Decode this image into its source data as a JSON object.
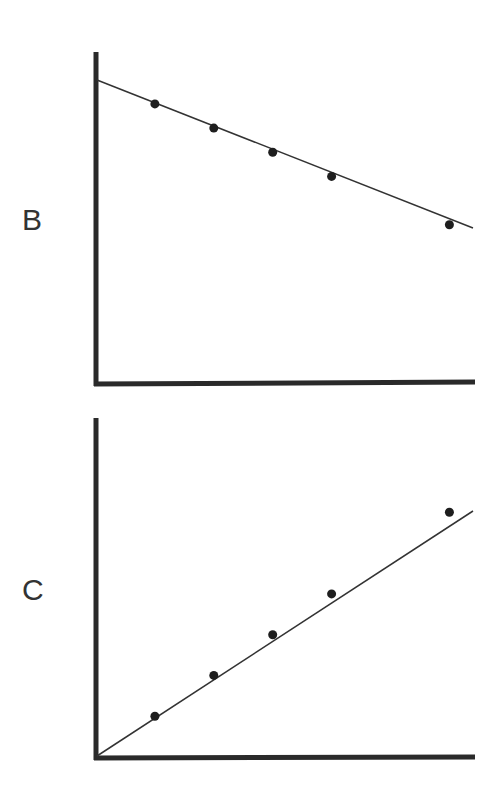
{
  "chart_data": [
    {
      "type": "scatter",
      "panel_label": "B",
      "title": "",
      "xlabel": "",
      "ylabel": "",
      "grid": false,
      "legend": null,
      "trend": "linear decreasing, positive y-intercept",
      "x": [
        1,
        2,
        3,
        4,
        6
      ],
      "values": [
        5.8,
        5.3,
        4.8,
        4.3,
        3.3
      ],
      "fit_line": {
        "intercept": 6.3,
        "slope": -0.5
      },
      "xlim": [
        0,
        6.4
      ],
      "ylim": [
        0,
        7.0
      ]
    },
    {
      "type": "scatter",
      "panel_label": "C",
      "title": "",
      "xlabel": "",
      "ylabel": "",
      "grid": false,
      "legend": null,
      "trend": "linear increasing through origin",
      "x": [
        1,
        2,
        3,
        4,
        6
      ],
      "values": [
        1.0,
        2.0,
        3.0,
        4.0,
        6.0
      ],
      "fit_line": {
        "intercept": 0,
        "slope": 1.0
      },
      "xlim": [
        0,
        6.4
      ],
      "ylim": [
        0,
        9.0
      ]
    }
  ],
  "panels": {
    "b": {
      "label": "B"
    },
    "c": {
      "label": "C"
    }
  },
  "colors": {
    "axis": "#2a2a2a",
    "line": "#333333",
    "marker": "#1e1e1e"
  }
}
